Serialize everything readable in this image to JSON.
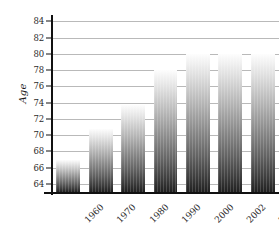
{
  "chart_data": {
    "type": "bar",
    "title": "",
    "subtitle": "",
    "xlabel": "",
    "ylabel": "Age",
    "categories": [
      "1960",
      "1970",
      "1980",
      "1990",
      "2000",
      "2002",
      "2003"
    ],
    "values": [
      66.9,
      70.8,
      73.7,
      78.0,
      80.0,
      80.0,
      80.0
    ],
    "series": [
      {
        "name": "Age",
        "values": [
          66.9,
          70.8,
          73.7,
          78.0,
          80.0,
          80.0,
          80.0
        ]
      }
    ],
    "ylim": [
      63.0,
      84.4
    ],
    "xlim": [
      0,
      7
    ],
    "y_ticks": [
      64,
      66,
      68,
      70,
      72,
      74,
      76,
      78,
      80,
      82,
      84
    ],
    "y_tick_labels": [
      "64",
      "66",
      "68",
      "70",
      "72",
      "74",
      "76",
      "78",
      "80",
      "82",
      "84"
    ],
    "grid": true,
    "grid_axis": "y",
    "legend": false,
    "legend_position": "none",
    "annotations": [],
    "bar_style": {
      "fill": "vertical-gradient",
      "gradient_top": "#fdfdfd",
      "gradient_bottom": "#202020",
      "edge": "none"
    },
    "axis_color": "#111111",
    "grid_color": "#b9b9b9",
    "text_color": "#2b2b2b",
    "background": "#ffffff",
    "x_tick_label_rotation": -45
  }
}
